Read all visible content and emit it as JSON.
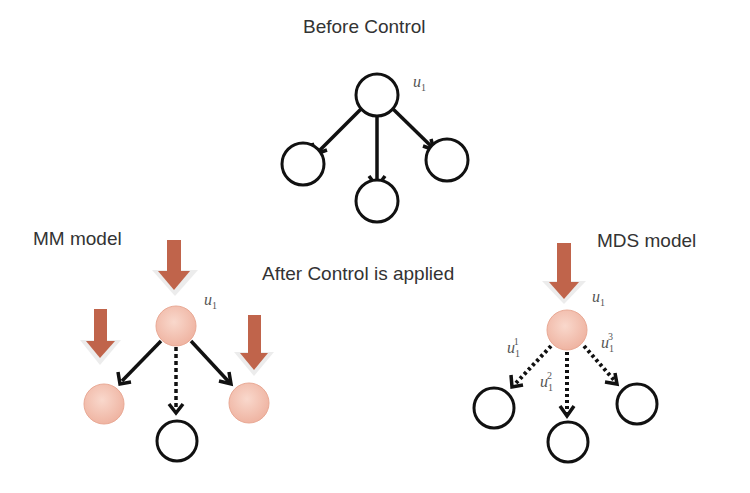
{
  "titles": {
    "before": "Before Control",
    "after": "After Control is applied",
    "mm_model": "MM model",
    "mds_model": "MDS model"
  },
  "labels": {
    "u": "u",
    "sub1": "1",
    "sup1": "1",
    "sup2": "2",
    "sup3": "3"
  },
  "colors": {
    "stroke": "#111111",
    "controlled_node": "#f3c2b3",
    "control_arrow": "#c0644b",
    "arrow_halo": "#f2f2f2"
  }
}
